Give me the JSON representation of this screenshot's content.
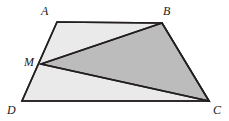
{
  "figure": {
    "kind": "geometry-diagram",
    "canvas": {
      "width": 229,
      "height": 121,
      "background": "#ffffff"
    },
    "colors": {
      "stroke": "#231f20",
      "trapezoid_fill": "#eaeaea",
      "triangle_fill": "#bcbcbc",
      "label_color": "#1a1a1a"
    },
    "stroke_width": 1.6,
    "points": {
      "A": {
        "x": 57,
        "y": 22
      },
      "B": {
        "x": 162,
        "y": 23
      },
      "C": {
        "x": 209,
        "y": 101
      },
      "D": {
        "x": 22,
        "y": 101
      },
      "M": {
        "x": 41,
        "y": 64
      }
    },
    "polygons": {
      "trapezoid": {
        "name": "ABCD",
        "points": "57,22 162,23 209,101 22,101"
      },
      "shaded_triangle": {
        "name": "MBC",
        "points": "41,64 162,23 209,101"
      }
    },
    "segments": [
      {
        "name": "MB",
        "x1": 41,
        "y1": 64,
        "x2": 162,
        "y2": 23
      },
      {
        "name": "MC",
        "x1": 41,
        "y1": 64,
        "x2": 209,
        "y2": 101
      }
    ],
    "labels": [
      {
        "id": "A",
        "text": "A",
        "x": 41,
        "y": 5
      },
      {
        "id": "B",
        "text": "B",
        "x": 163,
        "y": 5
      },
      {
        "id": "M",
        "text": "M",
        "x": 24,
        "y": 56
      },
      {
        "id": "D",
        "text": "D",
        "x": 7,
        "y": 104
      },
      {
        "id": "C",
        "text": "C",
        "x": 213,
        "y": 104
      }
    ]
  }
}
